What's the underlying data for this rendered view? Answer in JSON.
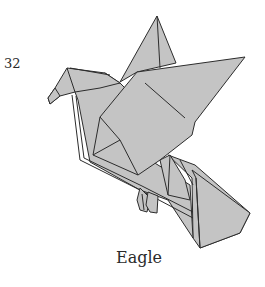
{
  "diagram": {
    "step_number": "32",
    "caption": "Eagle",
    "paper_color": "#c4c4c4",
    "line_color": "#2c2c2c"
  }
}
